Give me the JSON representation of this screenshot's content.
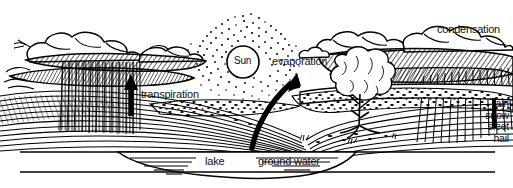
{
  "diagram": {
    "style": "black-and-white pen-and-ink line drawing",
    "colors": {
      "ink": "#000000",
      "background": "#ffffff"
    },
    "sun": {
      "label": "Sun",
      "shape": "circle-with-stippled-halo",
      "center": [
        243,
        62
      ],
      "radius": 16
    },
    "labels": {
      "evaporation": "evaporation",
      "transpiration": "transpiration",
      "condensation": "condensation",
      "lake": "lake",
      "ground_water": "ground water"
    },
    "precipitation": {
      "items": [
        "rain",
        "snow",
        "sleet",
        "hail"
      ]
    },
    "arrows": [
      {
        "name": "evaporation-arrow",
        "direction": "up-right",
        "from": [
          252,
          146
        ],
        "to": [
          297,
          74
        ]
      },
      {
        "name": "transpiration-arrow",
        "direction": "up",
        "from": [
          131,
          114
        ],
        "to": [
          131,
          75
        ]
      }
    ],
    "features": [
      "clouds",
      "hatched-hills",
      "rain-shaft-left",
      "rain-shaft-right",
      "tree",
      "lake-basin",
      "ground-water-layer"
    ]
  }
}
